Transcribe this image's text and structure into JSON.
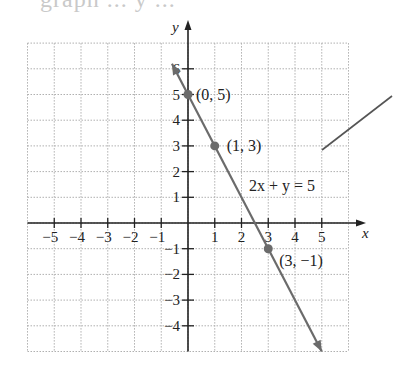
{
  "header": {
    "cut_text": "graph ... y ..."
  },
  "chart_data": {
    "type": "line",
    "title": "",
    "equation_label": "2x + y = 5",
    "xlabel": "x",
    "ylabel": "y",
    "xlim": [
      -6,
      6
    ],
    "ylim": [
      -5,
      7
    ],
    "grid": true,
    "x_ticks": [
      -5,
      -4,
      -3,
      -2,
      -1,
      1,
      2,
      3,
      4,
      5
    ],
    "x_tick_labels": [
      "−5",
      "−4",
      "−3",
      "−2",
      "−1",
      "1",
      "2",
      "3",
      "4",
      "5"
    ],
    "y_ticks": [
      -4,
      -3,
      -2,
      -1,
      1,
      2,
      3,
      4,
      5,
      6
    ],
    "y_tick_labels": [
      "−4",
      "−3",
      "−2",
      "−1",
      "1",
      "2",
      "3",
      "4",
      "5",
      "6"
    ],
    "line": {
      "slope": -2,
      "intercept": 5,
      "x_start": -0.6,
      "x_end": 5.0,
      "color": "#6b6b6b"
    },
    "points": [
      {
        "x": 0,
        "y": 5,
        "label": "(0, 5)"
      },
      {
        "x": 1,
        "y": 3,
        "label": "(1, 3)"
      },
      {
        "x": 3,
        "y": -1,
        "label": "(3, −1)"
      }
    ],
    "point_color": "#6b6b6b",
    "axis_color": "#222222",
    "grid_color": "#b0b0b0"
  }
}
